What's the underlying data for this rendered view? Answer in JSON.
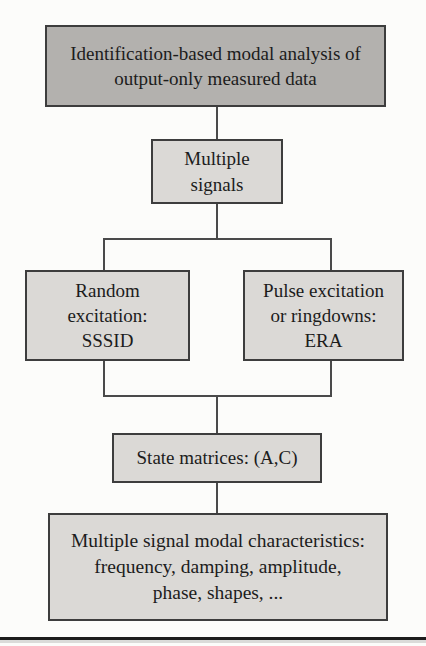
{
  "figure": {
    "type": "flowchart"
  },
  "nodes": {
    "root": {
      "lines": [
        "Identification-based modal analysis of",
        "output-only measured data"
      ]
    },
    "multiple_signals": {
      "lines": [
        "Multiple",
        "signals"
      ]
    },
    "random_excitation": {
      "lines": [
        "Random",
        "excitation:",
        "SSSID"
      ]
    },
    "pulse_excitation": {
      "lines": [
        "Pulse excitation",
        "or ringdowns:",
        "ERA"
      ]
    },
    "state_matrices": {
      "lines": [
        "State matrices: (A,C)"
      ]
    },
    "modal_characteristics": {
      "lines": [
        "Multiple signal modal characteristics:",
        "frequency, damping, amplitude,",
        "phase, shapes, ..."
      ]
    }
  },
  "colors": {
    "title_box_fill": "#b3b1ae",
    "node_box_fill": "#dbd9d6",
    "box_border": "#3d3d3d",
    "connector_line": "#4a4a4a",
    "bottom_rule": "#1c1c1c",
    "text": "#1c1c1c",
    "background": "#fcfcfa"
  }
}
